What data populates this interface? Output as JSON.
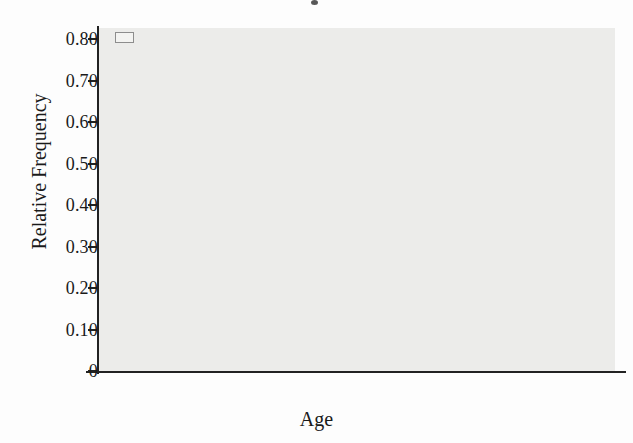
{
  "chart_data": {
    "type": "bar",
    "title": "",
    "xlabel": "Age",
    "ylabel": "Relative Frequency",
    "categories": [
      "18–34",
      "35–44",
      "45–54",
      "55+"
    ],
    "series": [
      {
        "name": "More likely",
        "values": [
          0.44,
          0.61,
          0.66,
          0.75
        ]
      },
      {
        "name": "Less likely",
        "values": [
          0.52,
          0.37,
          0.3,
          0.22
        ]
      },
      {
        "name": "Neither",
        "values": [
          0.03,
          0.01,
          0.04,
          0.03
        ]
      }
    ],
    "ylim": [
      0,
      0.85
    ],
    "yticks": [
      0,
      0.1,
      0.2,
      0.3,
      0.4,
      0.5,
      0.6,
      0.7,
      0.8
    ],
    "ytick_labels": [
      "0",
      "0.10",
      "0.20",
      "0.30",
      "0.40",
      "0.50",
      "0.60",
      "0.70",
      "0.80"
    ],
    "grid": false,
    "legend_position": "top-left",
    "bar_fill_color": "#b9b9b7",
    "bar_edge_color": "#262626",
    "plot_background_color": "#ececea"
  },
  "legend": {
    "items": [
      {
        "label": "More likely"
      },
      {
        "label": "Less likely"
      },
      {
        "label": "Neither"
      }
    ]
  }
}
